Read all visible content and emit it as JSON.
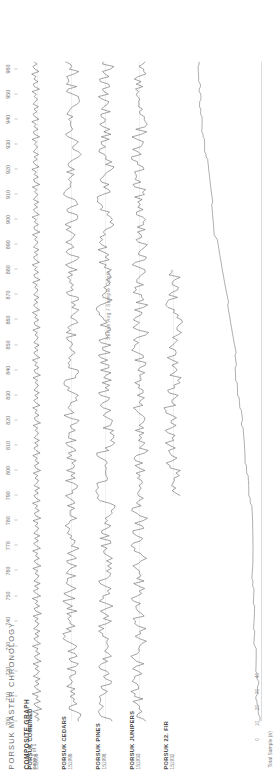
{
  "document": {
    "title": "PORSUK MASTER CHRONOLOGY",
    "subtitle": "COMPOSITE GRAPH",
    "page_note": "page 1 of 1"
  },
  "chart_data": {
    "type": "line",
    "title": "PORSUK MASTER CHRONOLOGY",
    "subtitle": "COMPOSITE GRAPH",
    "xlabel": "Year (A.D.)",
    "ylabel": "Ring Width Index",
    "xlim": [
      700,
      963
    ],
    "ylim": [
      0,
      2
    ],
    "grid": false,
    "legend_position": "left",
    "orientation": "rotated-90",
    "tick_step": 10,
    "xticks": [
      700,
      710,
      720,
      730,
      740,
      750,
      760,
      770,
      780,
      790,
      800,
      810,
      820,
      830,
      840,
      850,
      860,
      870,
      880,
      890,
      900,
      910,
      920,
      930,
      940,
      950,
      960
    ],
    "series": [
      {
        "name": "PORSUK COMBINED",
        "id": "151998",
        "start": 700,
        "end": 963,
        "color": "#5a5a5a",
        "values": [
          1.02,
          0.88,
          1.19,
          0.94,
          1.31,
          0.72,
          1.08,
          1.24,
          0.81,
          1.12,
          0.95,
          1.35,
          0.78,
          1.05,
          1.22,
          0.9,
          1.14,
          0.83,
          1.28,
          1.01,
          0.87,
          1.16,
          0.94,
          1.3,
          0.76,
          1.09,
          1.21,
          0.85,
          1.13,
          0.97,
          1.33,
          0.8,
          1.06,
          1.25,
          0.92,
          1.17,
          0.84,
          1.26,
          1.03,
          0.89,
          1.18,
          0.96,
          1.29,
          0.74,
          1.11,
          1.23,
          0.86,
          1.15,
          0.99,
          1.34,
          0.79,
          1.07,
          1.27,
          0.93,
          1.2,
          0.82,
          1.24,
          1.04,
          0.9,
          1.17,
          0.98,
          1.31,
          0.77,
          1.1,
          1.22,
          0.87,
          1.14,
          1.0,
          1.32,
          0.81,
          1.08,
          1.26,
          0.94,
          1.19,
          0.85,
          1.25,
          1.05,
          0.91,
          1.16,
          0.97,
          1.3,
          0.78,
          1.12,
          1.21,
          0.88,
          1.15,
          1.01,
          1.33,
          0.82,
          1.09,
          1.24,
          0.95,
          1.18,
          0.86,
          1.23,
          1.06,
          0.92,
          1.17,
          0.99,
          1.28,
          0.79,
          1.13,
          1.2,
          0.89,
          1.16,
          1.02,
          1.31,
          0.83,
          1.1,
          1.25,
          0.96,
          1.19,
          0.87,
          1.22,
          1.07,
          0.93,
          1.15,
          1.0,
          1.29,
          0.8,
          1.14,
          1.21,
          0.9,
          1.17,
          1.03,
          1.32,
          0.84,
          1.11,
          1.24,
          0.97,
          1.18,
          0.88,
          1.23,
          1.08,
          0.94,
          1.16,
          1.01,
          1.3,
          0.81,
          1.15,
          1.22,
          0.91,
          1.18,
          1.04,
          1.33,
          0.85,
          1.12,
          1.25,
          0.98,
          1.19,
          0.89,
          1.24,
          1.09,
          0.95,
          1.17,
          1.02,
          1.31,
          0.82,
          1.16,
          1.23,
          0.92,
          1.19,
          1.05,
          1.34,
          0.86,
          1.13,
          1.26,
          0.99,
          1.2,
          0.9,
          1.25,
          1.1,
          0.96,
          1.18,
          1.03,
          1.32,
          0.83,
          1.17,
          1.24,
          0.93,
          1.2,
          1.06,
          1.35,
          0.87,
          1.14,
          1.27,
          1.0,
          1.21,
          0.91,
          1.26,
          1.11,
          0.97,
          1.19,
          1.04,
          1.33,
          0.84,
          1.18,
          1.25,
          0.94,
          1.21,
          1.07,
          1.36,
          0.88,
          1.15,
          1.28,
          1.01,
          1.22,
          0.92,
          1.27,
          1.12,
          0.98,
          1.2,
          1.05,
          1.34,
          0.85,
          1.19,
          1.26,
          0.95,
          1.22,
          1.08,
          1.37,
          0.89,
          1.16,
          1.29,
          1.02,
          1.23,
          0.93,
          1.28,
          1.13,
          0.99,
          1.21,
          1.06,
          1.35,
          0.86,
          1.2,
          1.27,
          0.96,
          1.23,
          1.09,
          1.38,
          0.9,
          1.17,
          1.3,
          1.03,
          1.24,
          0.94,
          1.29,
          1.14,
          1.0,
          1.22,
          1.07,
          1.36,
          0.87,
          1.21,
          1.28,
          0.97,
          1.24,
          1.1,
          1.39,
          0.91,
          1.18,
          1.31,
          1.04,
          1.25,
          0.95,
          1.3,
          1.15,
          1.01,
          1.23,
          1.08,
          1.37,
          0.88
        ]
      },
      {
        "name": "PORSUK CEDARS",
        "id": "151998",
        "start": 700,
        "end": 963,
        "color": "#5a5a5a"
      },
      {
        "name": "PORSUK PINES",
        "id": "151998",
        "start": 700,
        "end": 963,
        "color": "#5a5a5a"
      },
      {
        "name": "PORSUK JUNIPERS",
        "id": "151930",
        "start": 700,
        "end": 963,
        "color": "#5a5a5a"
      },
      {
        "name": "PORSUK 22. FIR",
        "id": "151932",
        "start": 790,
        "end": 880,
        "color": "#5a5a5a"
      }
    ],
    "depth_panel": {
      "title": "Series Avg / Sample Depth",
      "xlabel": "Total Sample (n)",
      "ylabel": "Year (A.D.)",
      "xticks": [
        "0",
        "10",
        "20",
        "30",
        "40"
      ],
      "max_depth": 44
    }
  }
}
